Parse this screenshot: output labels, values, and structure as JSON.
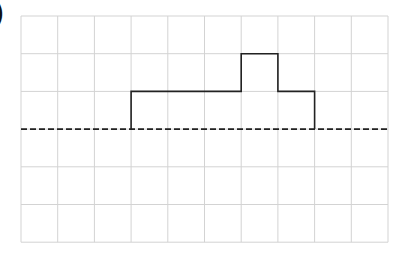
{
  "figure": {
    "label": ")",
    "grid": {
      "columns": 10,
      "rows": 6,
      "origin_x": 21,
      "origin_y": 16,
      "cell_w": 36.7,
      "cell_h": 37.7,
      "grid_color": "#d3d3d3"
    },
    "baseline": {
      "row_line": 3,
      "style": "dashed",
      "color": "#222222"
    },
    "shape": {
      "description": "step outline above dashed baseline",
      "color": "#222222",
      "points_in_cells": [
        [
          3,
          3
        ],
        [
          3,
          2
        ],
        [
          6,
          2
        ],
        [
          6,
          1
        ],
        [
          7,
          1
        ],
        [
          7,
          2
        ],
        [
          8,
          2
        ],
        [
          8,
          3
        ]
      ]
    }
  }
}
